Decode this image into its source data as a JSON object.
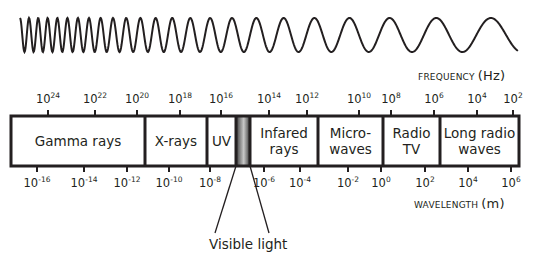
{
  "frequency_axis": {
    "label": "FREQUENCY",
    "unit": "(Hz)",
    "ticks": [
      {
        "base": "10",
        "exp": "24",
        "x": 48
      },
      {
        "base": "10",
        "exp": "22",
        "x": 95
      },
      {
        "base": "10",
        "exp": "20",
        "x": 137
      },
      {
        "base": "10",
        "exp": "18",
        "x": 180
      },
      {
        "base": "10",
        "exp": "16",
        "x": 221
      },
      {
        "base": "10",
        "exp": "14",
        "x": 269
      },
      {
        "base": "10",
        "exp": "12",
        "x": 307
      },
      {
        "base": "10",
        "exp": "10",
        "x": 359
      },
      {
        "base": "10",
        "exp": "8",
        "x": 391
      },
      {
        "base": "10",
        "exp": "6",
        "x": 434
      },
      {
        "base": "10",
        "exp": "4",
        "x": 477
      },
      {
        "base": "10",
        "exp": "2",
        "x": 513
      }
    ]
  },
  "wavelength_axis": {
    "label": "WAVELENGTH",
    "unit": "(m)",
    "ticks": [
      {
        "base": "10",
        "exp": "-16",
        "x": 37
      },
      {
        "base": "10",
        "exp": "-14",
        "x": 84
      },
      {
        "base": "10",
        "exp": "-12",
        "x": 127
      },
      {
        "base": "10",
        "exp": "-10",
        "x": 169
      },
      {
        "base": "10",
        "exp": "-8",
        "x": 210
      },
      {
        "base": "10",
        "exp": "-6",
        "x": 264
      },
      {
        "base": "10",
        "exp": "-4",
        "x": 300
      },
      {
        "base": "10",
        "exp": "-2",
        "x": 348
      },
      {
        "base": "10",
        "exp": "0",
        "x": 381
      },
      {
        "base": "10",
        "exp": "2",
        "x": 425
      },
      {
        "base": "10",
        "exp": "4",
        "x": 468
      },
      {
        "base": "10",
        "exp": "6",
        "x": 511
      }
    ]
  },
  "bands": [
    {
      "label": "Gamma rays",
      "x0": 11,
      "x1": 145
    },
    {
      "label": "X-rays",
      "x0": 145,
      "x1": 207
    },
    {
      "label": "UV",
      "x0": 207,
      "x1": 236
    },
    {
      "label": "Infared\nrays",
      "x0": 250,
      "x1": 318
    },
    {
      "label": "Micro-\nwaves",
      "x0": 318,
      "x1": 383
    },
    {
      "label": "Radio\nTV",
      "x0": 383,
      "x1": 440
    },
    {
      "label": "Long radio\nwaves",
      "x0": 440,
      "x1": 519
    }
  ],
  "visible_light": {
    "label": "Visible light",
    "x0": 236,
    "x1": 250
  },
  "colors": {
    "line": "#231f20",
    "visible_dark": "#3a3a3a",
    "visible_light": "#c8c8c8"
  }
}
